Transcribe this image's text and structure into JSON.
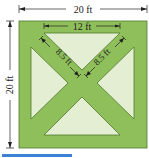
{
  "diagram": {
    "type": "garden-plan",
    "labels": {
      "outer_width": "20 ft",
      "outer_height": "20 ft",
      "top_triangle_base": "12 ft",
      "left_diagonal": "8.5 ft",
      "right_diagonal": "8.5 ft"
    },
    "colors": {
      "path_green": "#8fbf5a",
      "triangle_fill": "#e4eed3",
      "outline": "#4f7a2c",
      "dimension_line": "#222222",
      "accent_bar": "#3b82d6"
    }
  }
}
